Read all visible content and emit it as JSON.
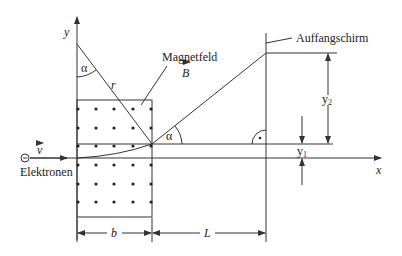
{
  "diagram": {
    "type": "physics-schematic",
    "labels": {
      "y_axis": "y",
      "x_axis": "x",
      "alpha_top": "α",
      "alpha_exit": "α",
      "radius": "r",
      "field_name": "Magnetfeld",
      "field_symbol": "B",
      "screen": "Auffangschirm",
      "velocity": "v",
      "electrons": "Elektronen",
      "electron_symbol": "−",
      "width_b": "b",
      "distance_L": "L",
      "y1_base": "y",
      "y1_sub": "1",
      "y2_base": "y",
      "y2_sub": "2",
      "right_angle_mark": "·"
    },
    "field_dots": {
      "columns_x": [
        78,
        96,
        114,
        133,
        151
      ],
      "rows_y": [
        109,
        128,
        146,
        165,
        184,
        202
      ]
    },
    "colors": {
      "line": "#333333",
      "text": "#222222",
      "background": "#ffffff"
    }
  }
}
